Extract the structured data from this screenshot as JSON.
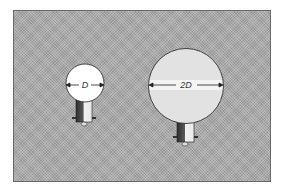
{
  "diagram": {
    "small_bulb": {
      "label": "D"
    },
    "large_bulb": {
      "label": "2D"
    },
    "colors": {
      "background": "#a9a9a9",
      "small_globe": "#ffffff",
      "large_globe": "#e2e2e2",
      "band": "#f4f4f4",
      "base_dark": "#3a3a3a",
      "base_light": "#f0f0f0"
    }
  }
}
